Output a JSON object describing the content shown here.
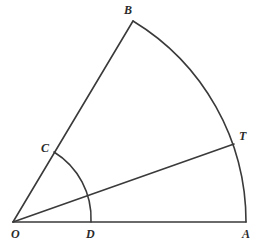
{
  "figure": {
    "kind": "geometry-diagram",
    "background_color": "#ffffff",
    "stroke_color": "#3a3a3a",
    "label_color": "#2b2b2b",
    "stroke_width": 1.6,
    "canvas": {
      "width": 264,
      "height": 250
    }
  },
  "points": [
    {
      "id": "O",
      "label": "O",
      "x": 13,
      "y": 222,
      "label_x": 11,
      "label_y": 238,
      "role": "center-vertex"
    },
    {
      "id": "A",
      "label": "A",
      "x": 246,
      "y": 222,
      "label_x": 242,
      "label_y": 238,
      "role": "arc-endpoint"
    },
    {
      "id": "B",
      "label": "B",
      "x": 133,
      "y": 21,
      "label_x": 124,
      "label_y": 14,
      "role": "arc-endpoint"
    },
    {
      "id": "C",
      "label": "C",
      "x": 54,
      "y": 152,
      "label_x": 41,
      "label_y": 152,
      "role": "small-arc-endpoint"
    },
    {
      "id": "D",
      "label": "D",
      "x": 91,
      "y": 222,
      "label_x": 86,
      "label_y": 238,
      "role": "small-arc-endpoint"
    },
    {
      "id": "T",
      "label": "T",
      "x": 234,
      "y": 144,
      "label_x": 239,
      "label_y": 140,
      "role": "tangent-point"
    }
  ],
  "segments": [
    {
      "id": "OA",
      "from": "O",
      "to": "A",
      "name": "segment-oa"
    },
    {
      "id": "OB",
      "from": "O",
      "to": "B",
      "name": "segment-ob"
    },
    {
      "id": "OT",
      "from": "O",
      "to": "T",
      "name": "segment-ot"
    }
  ],
  "arcs": [
    {
      "id": "BA",
      "name": "major-arc-ba",
      "from": "B",
      "to": "A",
      "center": "O",
      "radius": 235,
      "sweep": "clockwise-from-b-to-a",
      "path": "M 133 21 A 235 235 0 0 1 246 222"
    },
    {
      "id": "CD",
      "name": "minor-arc-cd",
      "from": "C",
      "to": "D",
      "center": "O",
      "radius": 78,
      "sweep": "clockwise-from-c-to-d",
      "path": "M 54 152 A 78 78 0 0 1 91 222"
    }
  ]
}
